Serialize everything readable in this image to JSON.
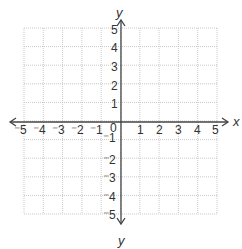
{
  "graph": {
    "x_axis_label": "x",
    "y_axis_label_top": "y",
    "y_axis_label_bottom": "y",
    "origin_label": "0",
    "x_min": -5,
    "x_max": 5,
    "y_min": -5,
    "y_max": 5,
    "x_ticks_negative": [
      "⁻5",
      "⁻4",
      "⁻3",
      "⁻2",
      "⁻1"
    ],
    "x_ticks_positive": [
      "1",
      "2",
      "3",
      "4",
      "5"
    ],
    "y_ticks_positive": [
      "5",
      "4",
      "3",
      "2",
      "1"
    ],
    "y_ticks_negative": [
      "⁻1",
      "⁻2",
      "⁻3",
      "⁻4",
      "⁻5"
    ],
    "colors": {
      "axis": "#444444",
      "grid": "#bbbbbb",
      "text": "#333333"
    }
  }
}
